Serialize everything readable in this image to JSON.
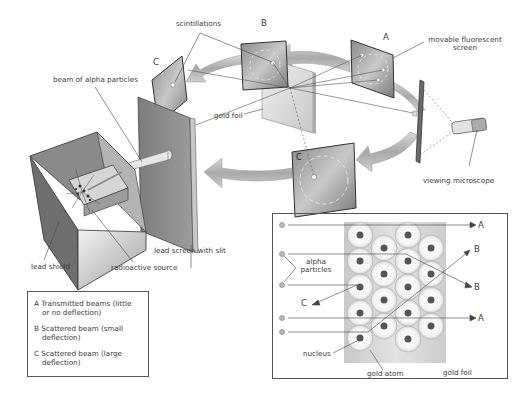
{
  "diagram": {
    "labels": {
      "scintillations": "scintillations",
      "beam_of_alpha_particles": "beam of alpha particles",
      "gold_foil": "gold foil",
      "movable_fluorescent_screen": "movable fluorescent screen",
      "movable_line1": "movable fluorescent",
      "movable_line2": "screen",
      "viewing_microscope": "viewing microscope",
      "lead_screen_with_slit": "lead screen with slit",
      "lead_shield": "lead shield",
      "radioactive_source": "radioactive source"
    },
    "screen_letters": {
      "a": "A",
      "b": "B",
      "c": "C"
    },
    "legend": {
      "items": [
        {
          "line1": "A Transmitted beams (little",
          "line2": "or no deflection)"
        },
        {
          "line1": "B Scattered beam (small",
          "line2": "deflection)"
        },
        {
          "line1": "C Scattered beam (large",
          "line2": "deflection)"
        }
      ]
    },
    "inset": {
      "alpha_particles_line1": "alpha",
      "alpha_particles_line2": "particles",
      "nucleus": "nucleus",
      "gold_atom": "gold atom",
      "gold_foil": "gold foil",
      "path_labels": {
        "a_top": "A",
        "b_upper": "B",
        "b_lower": "B",
        "c": "C",
        "a_bottom": "A"
      }
    },
    "colors": {
      "panel_dark": "#5a5a5a",
      "panel_mid": "#9a9a9a",
      "panel_light": "#d8d8d8",
      "arrow_fill": "#b8b8b8",
      "foil_bg": "#d6d6d6",
      "nucleus": "#555555",
      "line": "#444444"
    }
  }
}
